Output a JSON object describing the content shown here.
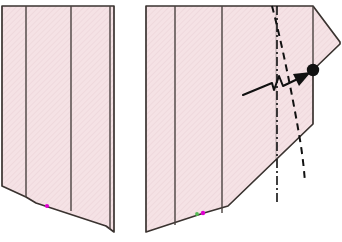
{
  "figure": {
    "background_color": "#ffffff",
    "width": 342,
    "height": 242,
    "style": {
      "fill_color": "#f5e2e5",
      "fill_color_alt": "#f3dee2",
      "outline_color": "#3a3330",
      "outline_width": 1.7,
      "divider_color": "#4a4240",
      "divider_width": 1.4,
      "annotation_color": "#111111",
      "marker_dot_color": "#111111",
      "marker_magenta": "#e000d0",
      "marker_green": "#55bb55",
      "hatch_color": "#e8cdd2"
    }
  },
  "shapes": {
    "left_section": {
      "name": "left-section-outline",
      "label": "Left partial section",
      "outline_points": "2,6 114,6 114,232 106,226 36,203 26,197 2,186",
      "dividers": [
        {
          "name": "divider-1",
          "points": "26,6 26,197"
        },
        {
          "name": "divider-2",
          "points": "71,6 71,211"
        },
        {
          "name": "divider-3",
          "points": "110,6 110,229"
        }
      ],
      "markers": [
        {
          "name": "vertex-marker-magenta",
          "cx": 47,
          "cy": 206,
          "r": 2.1,
          "color": "#e000d0"
        }
      ]
    },
    "right_section": {
      "name": "right-section-outline",
      "label": "Right partial section with pointed tip",
      "outline_points": "146,6 313,6 340,42 340,44 313,70 313,124 228,206 204,213 146,232",
      "dividers": [
        {
          "name": "divider-1",
          "points": "175,6 175,225"
        },
        {
          "name": "divider-2",
          "points": "222,6 222,213"
        },
        {
          "name": "divider-3",
          "points": "276,6 276,160"
        },
        {
          "name": "divider-4",
          "points": "313,6 313,70"
        }
      ],
      "markers": [
        {
          "name": "vertex-marker-magenta",
          "cx": 203,
          "cy": 213,
          "r": 2.2,
          "color": "#e000d0"
        },
        {
          "name": "vertex-marker-green",
          "cx": 197,
          "cy": 214,
          "r": 1.8,
          "color": "#55bb55"
        }
      ]
    }
  },
  "annotations": {
    "centerline": {
      "name": "dash-dot-centerline",
      "points": "277,6 277,205",
      "dash_pattern": "9,3,2,3",
      "color": "#111111",
      "width": 1.6
    },
    "dashed_curve": {
      "name": "dashed-reference-curve",
      "path": "M 272,6 C 281,40 292,92 300,140 C 303,158 304,170 305,182",
      "dash_pattern": "7,5",
      "color": "#111111",
      "width": 2.0
    },
    "leader_arrow": {
      "name": "zigzag-leader-arrow",
      "label": "Leader line with zigzag break pointing to node",
      "path": "M 243,95 L 272,83 L 274,90 L 279,76 L 283,86 L 306,75",
      "color": "#111111",
      "width": 2.0,
      "arrowhead": {
        "name": "arrowhead",
        "points": "310,73 294,75 299,85",
        "color": "#111111"
      }
    },
    "node_dot": {
      "name": "node-marker-dot",
      "cx": 313,
      "cy": 70,
      "r": 6.2,
      "color": "#111111"
    }
  }
}
